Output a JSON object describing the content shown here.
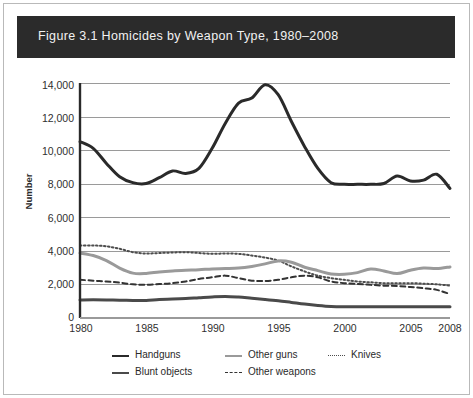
{
  "figure": {
    "label": "Figure 3.1",
    "title": "Figure 3.1   Homicides by Weapon Type, 1980–2008",
    "band_color": "#2b2b2b",
    "band_text_color": "#f2f2f2",
    "background": "#ffffff"
  },
  "axes": {
    "ylabel": "Number",
    "yticks": [
      "0",
      "2,000",
      "4,000",
      "6,000",
      "8,000",
      "10,000",
      "12,000",
      "14,000"
    ],
    "xticks": [
      "1980",
      "1985",
      "1990",
      "1995",
      "2000",
      "2005",
      "2008"
    ]
  },
  "legend": {
    "items": [
      {
        "label": "Handguns",
        "style": "solid-thick",
        "color": "#2a2a2a"
      },
      {
        "label": "Other guns",
        "style": "solid-thick",
        "color": "#9a9a9a"
      },
      {
        "label": "Knives",
        "style": "dotted",
        "color": "#4d4d4d"
      },
      {
        "label": "Blunt objects",
        "style": "solid-thick",
        "color": "#4a4a4a"
      },
      {
        "label": "Other weapons",
        "style": "dashed",
        "color": "#333333"
      }
    ]
  },
  "chart_data": {
    "type": "line",
    "title": "Figure 3.1   Homicides by Weapon Type, 1980–2008",
    "xlabel": "",
    "ylabel": "Number",
    "xlim": [
      1980,
      2008
    ],
    "ylim": [
      0,
      14000
    ],
    "ytick_step": 2000,
    "grid": "horizontal",
    "legend_position": "bottom",
    "x": [
      1980,
      1981,
      1982,
      1983,
      1984,
      1985,
      1986,
      1987,
      1988,
      1989,
      1990,
      1991,
      1992,
      1993,
      1994,
      1995,
      1996,
      1997,
      1998,
      1999,
      2000,
      2001,
      2002,
      2003,
      2004,
      2005,
      2006,
      2007,
      2008
    ],
    "series": [
      {
        "name": "Handguns",
        "color": "#2a2a2a",
        "style": "solid",
        "width": 3.0,
        "values": [
          10500,
          10100,
          9200,
          8400,
          8050,
          8000,
          8350,
          8750,
          8600,
          8900,
          10100,
          11600,
          12800,
          13100,
          13900,
          13300,
          11700,
          10200,
          8900,
          8050,
          7950,
          7950,
          7950,
          8000,
          8450,
          8150,
          8200,
          8550,
          7700
        ]
      },
      {
        "name": "Other guns",
        "color": "#9a9a9a",
        "style": "solid",
        "width": 3.0,
        "values": [
          3850,
          3700,
          3400,
          2950,
          2650,
          2630,
          2720,
          2780,
          2820,
          2850,
          2900,
          2920,
          2950,
          3050,
          3200,
          3380,
          3300,
          3000,
          2800,
          2600,
          2580,
          2680,
          2900,
          2780,
          2620,
          2820,
          2950,
          2920,
          3020
        ]
      },
      {
        "name": "Knives",
        "color": "#4d4d4d",
        "style": "dotted",
        "width": 2.0,
        "values": [
          4300,
          4300,
          4250,
          4100,
          3900,
          3820,
          3850,
          3880,
          3900,
          3850,
          3800,
          3820,
          3800,
          3700,
          3580,
          3400,
          3050,
          2750,
          2500,
          2350,
          2250,
          2150,
          2100,
          2050,
          2050,
          2050,
          2020,
          1980,
          1900
        ]
      },
      {
        "name": "Other weapons",
        "color": "#333333",
        "style": "dashed",
        "width": 2.0,
        "values": [
          2250,
          2200,
          2150,
          2080,
          1980,
          1950,
          2000,
          2050,
          2150,
          2300,
          2400,
          2500,
          2350,
          2200,
          2180,
          2250,
          2400,
          2500,
          2400,
          2150,
          2050,
          2000,
          1950,
          1900,
          1880,
          1820,
          1750,
          1650,
          1400
        ]
      },
      {
        "name": "Blunt objects",
        "color": "#4a4a4a",
        "style": "solid",
        "width": 3.0,
        "values": [
          1050,
          1060,
          1050,
          1030,
          1020,
          1020,
          1080,
          1100,
          1130,
          1180,
          1230,
          1260,
          1220,
          1150,
          1080,
          1000,
          900,
          800,
          720,
          660,
          640,
          640,
          640,
          640,
          640,
          640,
          640,
          640,
          640
        ]
      }
    ]
  }
}
